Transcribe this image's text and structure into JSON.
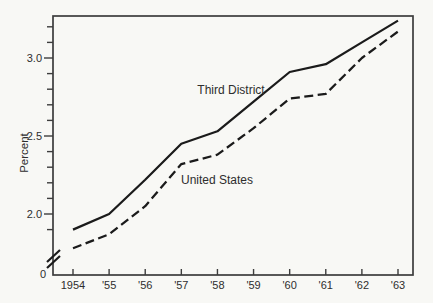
{
  "figure": {
    "background": "#f8f8f5",
    "line_color": "#1b1b1b",
    "axis_color": "#3d3d3d",
    "text_color": "#2e2e2e"
  },
  "chart_data": {
    "type": "line",
    "title": "",
    "xlabel": "",
    "ylabel": "Percent",
    "x_tick_labels": [
      "1954",
      "'55",
      "'56",
      "'57",
      "'58",
      "'59",
      "'60",
      "'61",
      "'62",
      "'63"
    ],
    "y_tick_labels": [
      "2.0",
      "2.5",
      "3.0"
    ],
    "y_ticks_labeled": [
      2.0,
      2.5,
      3.0
    ],
    "y_minor_tick_step": 0.1,
    "y_minor_tick_range": [
      1.9,
      3.2
    ],
    "y_axis_origin_label": "0",
    "axis_break": true,
    "ylim": [
      1.85,
      3.3
    ],
    "grid": false,
    "legend_position": "inline-labels",
    "series": [
      {
        "name": "Third District",
        "style": "solid",
        "values": [
          1.9,
          2.0,
          2.22,
          2.45,
          2.53,
          2.72,
          2.91,
          2.96,
          3.1,
          3.24
        ]
      },
      {
        "name": "United States",
        "style": "dashed",
        "values": [
          1.78,
          1.87,
          2.05,
          2.32,
          2.38,
          2.55,
          2.74,
          2.77,
          3.0,
          3.17
        ]
      }
    ]
  }
}
